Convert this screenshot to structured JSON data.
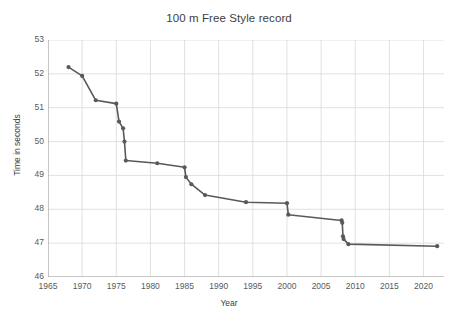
{
  "chart_data": {
    "type": "line",
    "title": "100 m Free Style record",
    "xlabel": "Year",
    "ylabel": "Time in seconds",
    "xlim": [
      1965,
      2023
    ],
    "ylim": [
      46,
      53
    ],
    "xticks": [
      1965,
      1970,
      1975,
      1980,
      1985,
      1990,
      1995,
      2000,
      2005,
      2010,
      2015,
      2020
    ],
    "yticks": [
      46,
      47,
      48,
      49,
      50,
      51,
      52,
      53
    ],
    "grid": true,
    "legend": "none",
    "series_color": "#595959",
    "grid_color": "#d9d9d9",
    "marker": "circle",
    "series": [
      {
        "name": "100 m Free Style record",
        "points": [
          {
            "x": 1968,
            "y": 52.2
          },
          {
            "x": 1970,
            "y": 51.94
          },
          {
            "x": 1972,
            "y": 51.22
          },
          {
            "x": 1975,
            "y": 51.12
          },
          {
            "x": 1975.4,
            "y": 50.59
          },
          {
            "x": 1976,
            "y": 50.39
          },
          {
            "x": 1976.2,
            "y": 50.0
          },
          {
            "x": 1976.4,
            "y": 49.44
          },
          {
            "x": 1981,
            "y": 49.36
          },
          {
            "x": 1985,
            "y": 49.24
          },
          {
            "x": 1985.2,
            "y": 48.95
          },
          {
            "x": 1986,
            "y": 48.74
          },
          {
            "x": 1988,
            "y": 48.42
          },
          {
            "x": 1994,
            "y": 48.21
          },
          {
            "x": 2000,
            "y": 48.18
          },
          {
            "x": 2000.2,
            "y": 47.84
          },
          {
            "x": 2008,
            "y": 47.67
          },
          {
            "x": 2008.1,
            "y": 47.6
          },
          {
            "x": 2008.2,
            "y": 47.2
          },
          {
            "x": 2008.3,
            "y": 47.12
          },
          {
            "x": 2009,
            "y": 46.97
          },
          {
            "x": 2022,
            "y": 46.91
          }
        ]
      }
    ]
  },
  "axes": {
    "y_tick_labels": [
      "53",
      "52",
      "51",
      "50",
      "49",
      "48",
      "47",
      "46"
    ],
    "x_tick_labels": [
      "1965",
      "1970",
      "1975",
      "1980",
      "1985",
      "1990",
      "1995",
      "2000",
      "2005",
      "2010",
      "2015",
      "2020"
    ]
  }
}
